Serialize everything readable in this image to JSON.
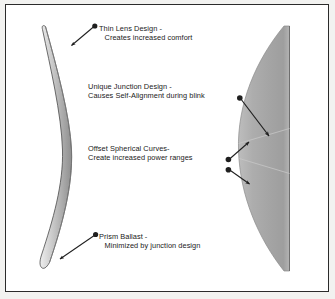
{
  "diagram": {
    "title_alt": "Contact lens design cross-section diagram",
    "background_color": "#ffffff",
    "border_color": "#2b2b2b",
    "page_color": "#f2f2f0",
    "lens_fill_color": "#a8a8a8",
    "lens_outline_color": "#4a4a4a",
    "marker_color": "#1f1f1f",
    "annotations": [
      {
        "id": "thin-lens",
        "line1": "Thin Lens Design -",
        "line2": "Creates increased comfort",
        "has_leading_bullet": true
      },
      {
        "id": "unique-junction",
        "line1": "Unique Junction Design -",
        "line2": "Causes Self-Alignment during blink",
        "has_leading_bullet": false
      },
      {
        "id": "offset-spherical-curves",
        "line1": "Offset Spherical Curves-",
        "line2": "Create increased power ranges",
        "has_leading_bullet": false
      },
      {
        "id": "prism-ballast",
        "line1": "Prism Ballast -",
        "line2": "Minimized by junction design",
        "has_leading_bullet": true
      }
    ],
    "shapes": {
      "left_lens_name": "thin crescent lens profile",
      "right_lens_name": "half lens cross-section with junction lines"
    }
  }
}
